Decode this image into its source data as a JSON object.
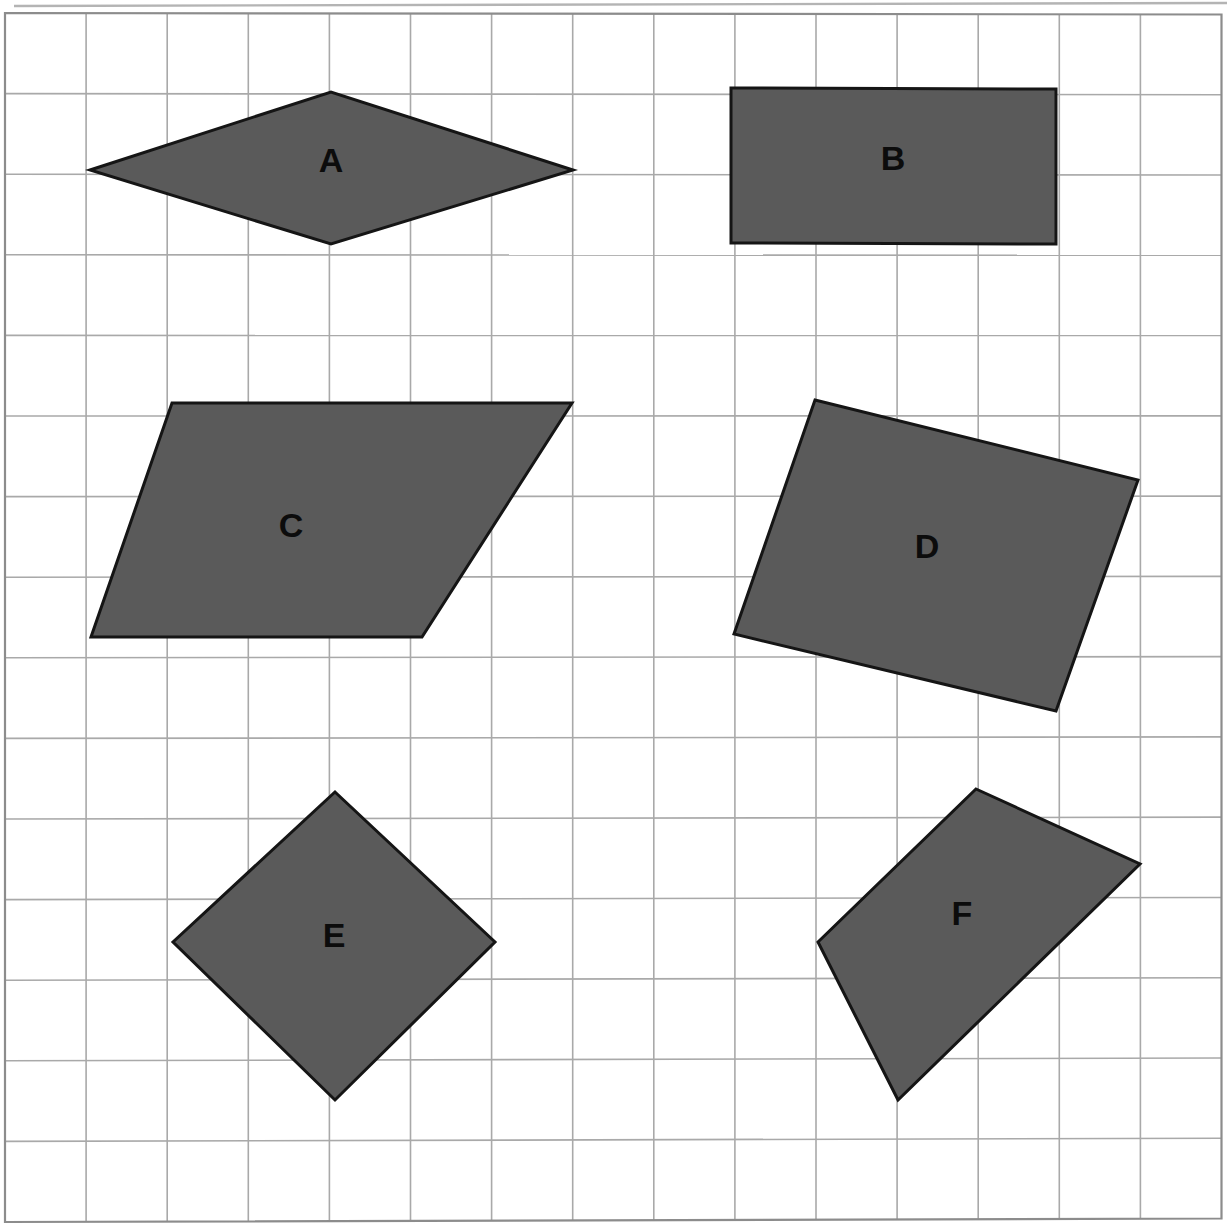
{
  "page": {
    "width": 1231,
    "height": 1230,
    "background_color": "#ffffff"
  },
  "grid": {
    "name": "square-grid",
    "columns": 15,
    "rows": 15,
    "cell_width": 80.9,
    "cell_height": 80.6,
    "origin_x": 5,
    "origin_y": 13,
    "line_color": "#a9a9a9",
    "border_color": "#8c8c8c",
    "line_width": 1.6,
    "border_width": 2.2,
    "top_rule_y": 3,
    "top_rule_color": "#b4b4b4"
  },
  "style": {
    "shape_fill": "#5a5a5a",
    "shape_stroke": "#151515",
    "shape_stroke_width": 3,
    "label_color": "#0c0c0c"
  },
  "shapes": [
    {
      "id": "A",
      "label": "A",
      "kind": "rhombus",
      "points": "90,170 331,92 573,170 331,244",
      "label_x": 331,
      "label_y": 160
    },
    {
      "id": "B",
      "label": "B",
      "kind": "rectangle",
      "points": "731,88 1056,89 1056,244 731,243",
      "label_x": 893,
      "label_y": 158
    },
    {
      "id": "C",
      "label": "C",
      "kind": "parallelogram",
      "points": "172,403 572,403 422,637 91,637",
      "label_x": 291,
      "label_y": 525
    },
    {
      "id": "D",
      "label": "D",
      "kind": "tilted-quadrilateral",
      "points": "815,400 1138,480 1056,711 734,634",
      "label_x": 927,
      "label_y": 546
    },
    {
      "id": "E",
      "label": "E",
      "kind": "square-rotated",
      "points": "335,792 495,942 335,1100 173,942",
      "label_x": 334,
      "label_y": 935
    },
    {
      "id": "F",
      "label": "F",
      "kind": "tilted-quadrilateral",
      "points": "976,789 1140,864 898,1100 818,942",
      "label_x": 962,
      "label_y": 913
    }
  ]
}
